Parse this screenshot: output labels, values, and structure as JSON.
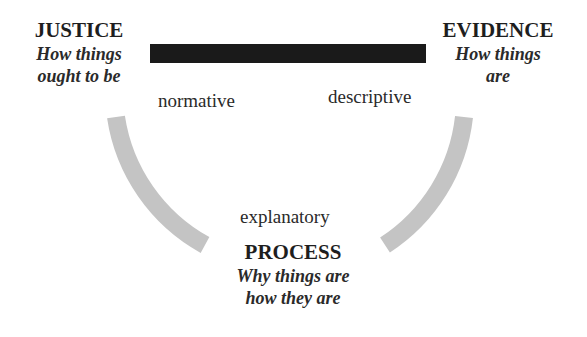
{
  "diagram": {
    "nodes": {
      "justice": {
        "title": "JUSTICE",
        "subtitle_line1": "How things",
        "subtitle_line2": "ought to be"
      },
      "evidence": {
        "title": "EVIDENCE",
        "subtitle_line1": "How things",
        "subtitle_line2": "are"
      },
      "process": {
        "title": "PROCESS",
        "subtitle_line1": "Why things are",
        "subtitle_line2": "how they are"
      }
    },
    "edges": {
      "top_bar": {
        "from": "JUSTICE",
        "to": "EVIDENCE",
        "color": "#1a1a1a"
      },
      "left_arc": {
        "from": "JUSTICE",
        "to": "PROCESS",
        "color": "#c4c4c4"
      },
      "right_arc": {
        "from": "EVIDENCE",
        "to": "PROCESS",
        "color": "#c4c4c4"
      }
    },
    "labels": {
      "normative": "normative",
      "descriptive": "descriptive",
      "explanatory": "explanatory"
    }
  }
}
